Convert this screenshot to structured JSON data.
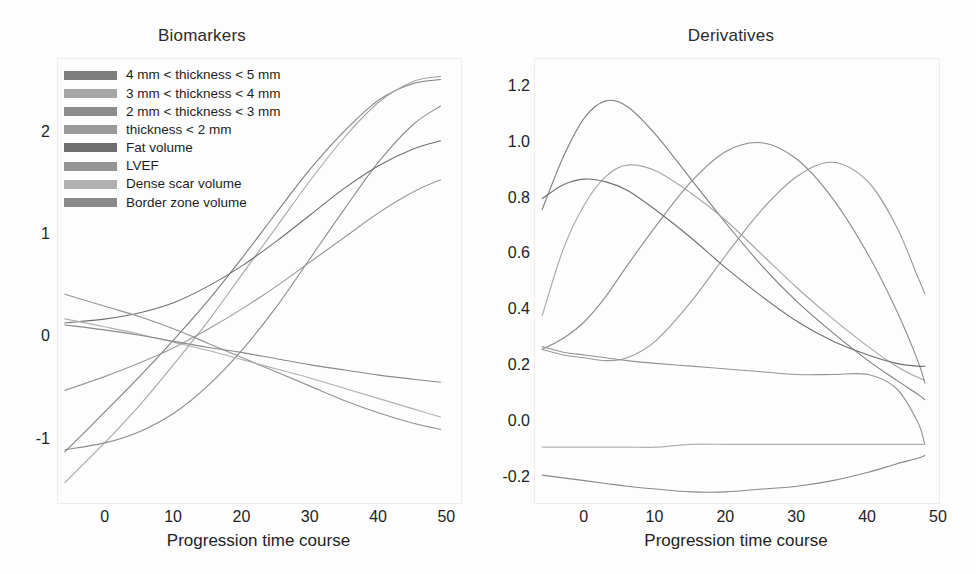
{
  "figure": {
    "background": "#fdfdfd",
    "panels": [
      "Biomarkers",
      "Derivatives"
    ]
  },
  "legend": {
    "entries": [
      {
        "label": "4 mm < thickness < 5 mm",
        "color": "#7f7f7f"
      },
      {
        "label": "3 mm < thickness < 4 mm",
        "color": "#a6a6a6"
      },
      {
        "label": "2 mm < thickness < 3 mm",
        "color": "#8c8c8c"
      },
      {
        "label": "thickness < 2 mm",
        "color": "#9a9a9a"
      },
      {
        "label": "Fat volume",
        "color": "#6f6f6f"
      },
      {
        "label": "LVEF",
        "color": "#949494"
      },
      {
        "label": "Dense scar volume",
        "color": "#b0b0b0"
      },
      {
        "label": "Border zone volume",
        "color": "#8a8a8a"
      }
    ]
  },
  "chart_data": [
    {
      "id": "biomarkers",
      "type": "line",
      "title": "Biomarkers",
      "xlabel": "Progression time course",
      "ylabel": "",
      "xlim": [
        -7,
        52
      ],
      "ylim": [
        -1.62,
        2.72
      ],
      "xticks": [
        0,
        10,
        20,
        30,
        40,
        50
      ],
      "yticks": [
        -1,
        0,
        1,
        2
      ],
      "grid": false,
      "legend_position": "upper-left",
      "x": [
        -6,
        0,
        5,
        10,
        15,
        20,
        25,
        30,
        35,
        40,
        45,
        49
      ],
      "series": [
        {
          "name": "4 mm < thickness < 5 mm",
          "color": "#7f7f7f",
          "values": [
            -1.12,
            -0.72,
            -0.38,
            -0.02,
            0.36,
            0.78,
            1.22,
            1.65,
            2.02,
            2.32,
            2.48,
            2.52
          ]
        },
        {
          "name": "3 mm < thickness < 4 mm",
          "color": "#a6a6a6",
          "values": [
            -1.42,
            -1.02,
            -0.66,
            -0.26,
            0.16,
            0.62,
            1.08,
            1.54,
            1.96,
            2.3,
            2.5,
            2.55
          ]
        },
        {
          "name": "2 mm < thickness < 3 mm",
          "color": "#8c8c8c",
          "values": [
            -1.1,
            -1.03,
            -0.92,
            -0.74,
            -0.47,
            -0.12,
            0.3,
            0.78,
            1.26,
            1.72,
            2.08,
            2.26
          ]
        },
        {
          "name": "thickness < 2 mm",
          "color": "#9a9a9a",
          "values": [
            -0.52,
            -0.38,
            -0.25,
            -0.1,
            0.08,
            0.28,
            0.5,
            0.74,
            0.98,
            1.22,
            1.42,
            1.54
          ]
        },
        {
          "name": "Fat volume",
          "color": "#6f6f6f",
          "values": [
            0.14,
            0.18,
            0.24,
            0.34,
            0.5,
            0.7,
            0.94,
            1.2,
            1.46,
            1.68,
            1.84,
            1.92
          ]
        },
        {
          "name": "LVEF",
          "color": "#949494",
          "values": [
            0.42,
            0.3,
            0.2,
            0.08,
            -0.06,
            -0.2,
            -0.34,
            -0.48,
            -0.62,
            -0.74,
            -0.84,
            -0.9
          ]
        },
        {
          "name": "Dense scar volume",
          "color": "#b0b0b0",
          "values": [
            0.18,
            0.1,
            0.03,
            -0.05,
            -0.13,
            -0.22,
            -0.31,
            -0.4,
            -0.5,
            -0.6,
            -0.7,
            -0.78
          ]
        },
        {
          "name": "Border zone volume",
          "color": "#8a8a8a",
          "values": [
            0.12,
            0.07,
            0.02,
            -0.04,
            -0.1,
            -0.15,
            -0.21,
            -0.27,
            -0.32,
            -0.37,
            -0.41,
            -0.44
          ]
        }
      ]
    },
    {
      "id": "derivatives",
      "type": "line",
      "title": "Derivatives",
      "xlabel": "Progression time course",
      "ylabel": "",
      "xlim": [
        -7,
        50
      ],
      "ylim": [
        -0.29,
        1.3
      ],
      "xticks": [
        0,
        10,
        20,
        30,
        40,
        50
      ],
      "yticks": [
        -0.2,
        0.0,
        0.2,
        0.4,
        0.6,
        0.8,
        1.0,
        1.2
      ],
      "grid": false,
      "legend_position": "none",
      "x": [
        -6,
        -3,
        0,
        3,
        6,
        10,
        15,
        20,
        25,
        30,
        35,
        40,
        44,
        47,
        48
      ],
      "series": [
        {
          "name": "4 mm < thickness < 5 mm",
          "color": "#7f7f7f",
          "values": [
            0.76,
            0.95,
            1.09,
            1.15,
            1.13,
            1.03,
            0.87,
            0.71,
            0.56,
            0.43,
            0.32,
            0.22,
            0.15,
            0.1,
            0.08
          ]
        },
        {
          "name": "3 mm < thickness < 4 mm",
          "color": "#a6a6a6",
          "values": [
            0.38,
            0.62,
            0.78,
            0.88,
            0.92,
            0.9,
            0.82,
            0.72,
            0.6,
            0.48,
            0.37,
            0.27,
            0.2,
            0.16,
            0.15
          ]
        },
        {
          "name": "2 mm < thickness < 3 mm",
          "color": "#8c8c8c",
          "values": [
            0.26,
            0.3,
            0.36,
            0.45,
            0.56,
            0.7,
            0.86,
            0.97,
            1.0,
            0.94,
            0.8,
            0.6,
            0.4,
            0.22,
            0.14
          ]
        },
        {
          "name": "thickness < 2 mm",
          "color": "#9a9a9a",
          "values": [
            0.26,
            0.24,
            0.23,
            0.22,
            0.23,
            0.29,
            0.43,
            0.6,
            0.76,
            0.88,
            0.93,
            0.86,
            0.7,
            0.52,
            0.46
          ]
        },
        {
          "name": "Fat volume",
          "color": "#6f6f6f",
          "values": [
            0.8,
            0.85,
            0.87,
            0.86,
            0.83,
            0.76,
            0.66,
            0.55,
            0.45,
            0.36,
            0.29,
            0.24,
            0.21,
            0.2,
            0.2
          ]
        },
        {
          "name": "LVEF",
          "color": "#949494",
          "values": [
            0.27,
            0.25,
            0.24,
            0.23,
            0.22,
            0.21,
            0.2,
            0.19,
            0.18,
            0.17,
            0.17,
            0.17,
            0.12,
            0.0,
            -0.08
          ]
        },
        {
          "name": "Dense scar volume",
          "color": "#b0b0b0",
          "values": [
            -0.09,
            -0.09,
            -0.09,
            -0.09,
            -0.09,
            -0.09,
            -0.08,
            -0.08,
            -0.08,
            -0.08,
            -0.08,
            -0.08,
            -0.08,
            -0.08,
            -0.08
          ]
        },
        {
          "name": "Border zone volume",
          "color": "#8a8a8a",
          "values": [
            -0.19,
            -0.2,
            -0.21,
            -0.22,
            -0.23,
            -0.24,
            -0.25,
            -0.25,
            -0.24,
            -0.23,
            -0.21,
            -0.18,
            -0.15,
            -0.13,
            -0.12
          ]
        }
      ]
    }
  ]
}
